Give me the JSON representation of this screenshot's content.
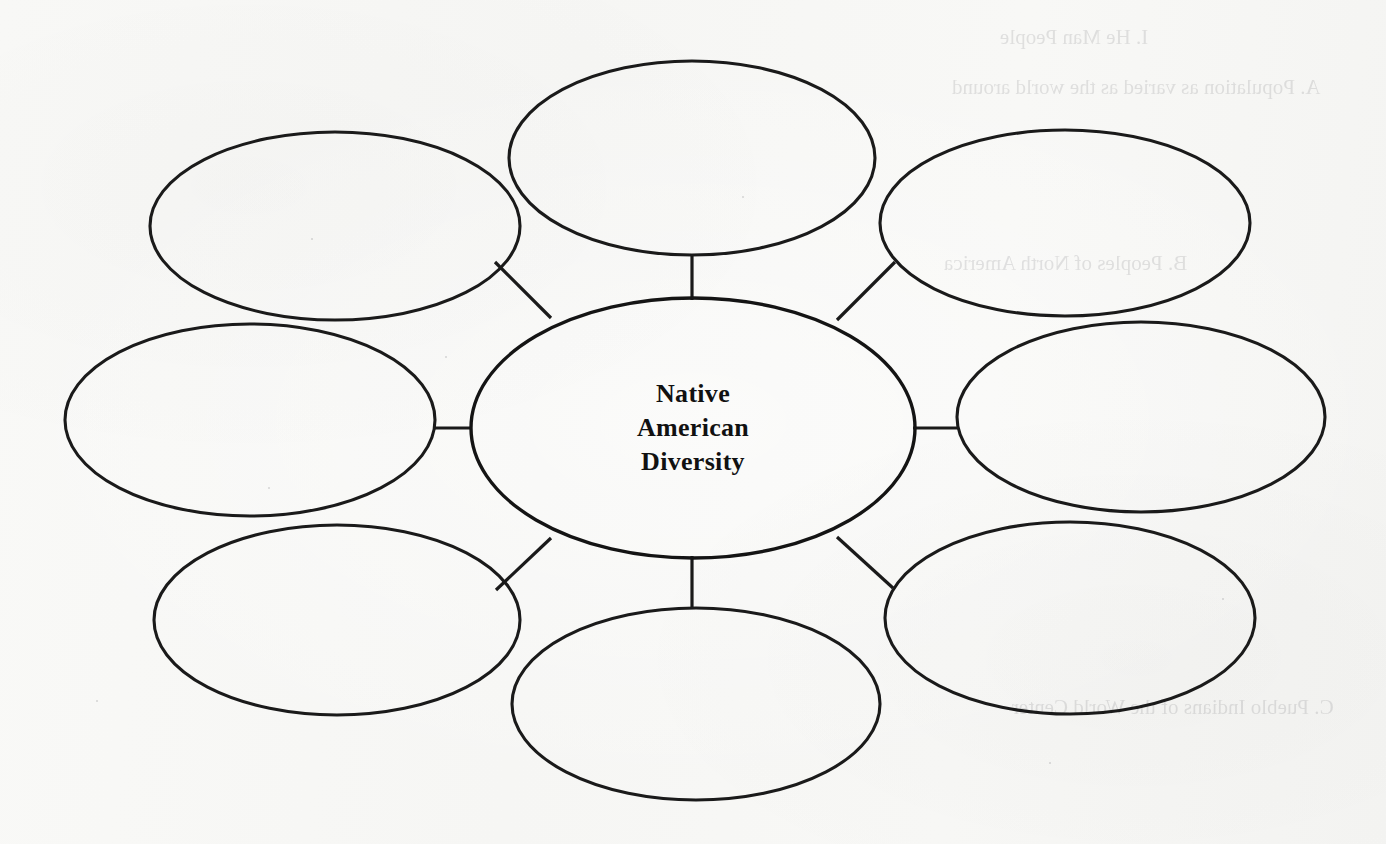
{
  "document": {
    "type": "graphic-organizer",
    "kind": "bubble-web-diagram",
    "background_color": "#f7f7f5",
    "ink_color": "#1a1a1a"
  },
  "center_node": {
    "name": "center-topic",
    "lines": [
      "Native",
      "American",
      "Diversity"
    ],
    "full_text": "Native American Diversity"
  },
  "outer_nodes": [
    {
      "id": "top",
      "label": "",
      "position": "top"
    },
    {
      "id": "top-left",
      "label": "",
      "position": "top-left"
    },
    {
      "id": "top-right",
      "label": "",
      "position": "top-right"
    },
    {
      "id": "left",
      "label": "",
      "position": "left"
    },
    {
      "id": "right",
      "label": "",
      "position": "right"
    },
    {
      "id": "bottom-left",
      "label": "",
      "position": "bottom-left"
    },
    {
      "id": "bottom",
      "label": "",
      "position": "bottom"
    },
    {
      "id": "bottom-right",
      "label": "",
      "position": "bottom-right"
    }
  ],
  "connectors": [
    {
      "from": "center",
      "to": "top",
      "style": "vertical"
    },
    {
      "from": "center",
      "to": "bottom",
      "style": "vertical"
    },
    {
      "from": "center",
      "to": "left",
      "style": "horizontal"
    },
    {
      "from": "center",
      "to": "right",
      "style": "horizontal"
    },
    {
      "from": "center",
      "to": "top-left",
      "style": "diagonal"
    },
    {
      "from": "center",
      "to": "top-right",
      "style": "diagonal"
    },
    {
      "from": "center",
      "to": "bottom-left",
      "style": "diagonal"
    },
    {
      "from": "center",
      "to": "bottom-right",
      "style": "diagonal"
    }
  ],
  "show_through_text": {
    "note": "faint mirrored bleed-through from the reverse side of the scanned page",
    "lines": [
      "I. He Man People",
      "A. Population as varied as the world around",
      "B. Peoples of North America",
      "C. Pueblo Indians of the World Center"
    ]
  }
}
